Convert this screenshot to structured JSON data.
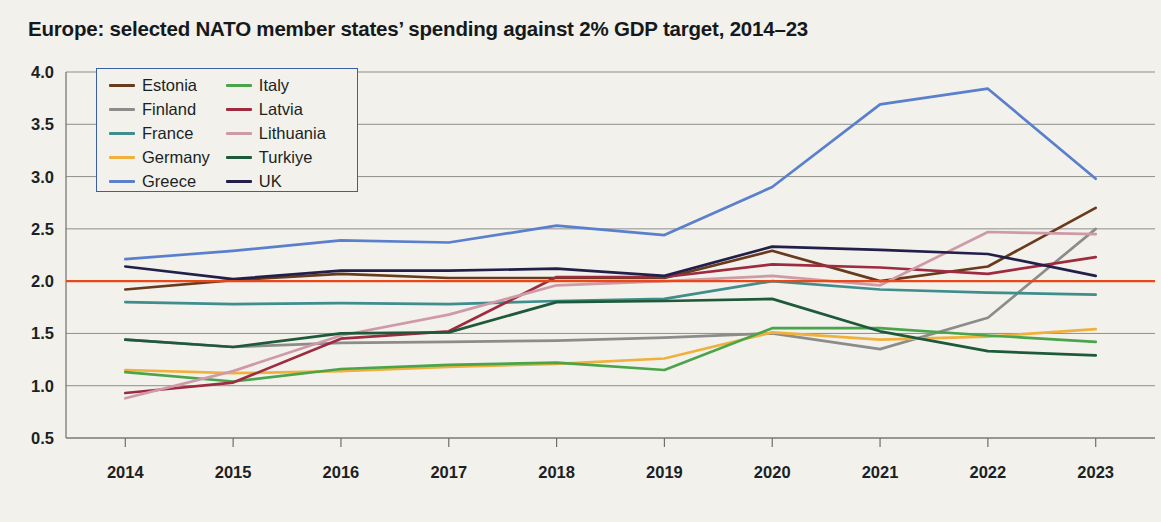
{
  "header": {
    "title": "Europe: selected NATO member states’ spending against 2% GDP target, 2014–23"
  },
  "legend": {
    "position": "top-left-inside",
    "border_color": "#3b5fa5",
    "columns": [
      [
        "Estonia",
        "Finland",
        "France",
        "Germany",
        "Greece"
      ],
      [
        "Italy",
        "Latvia",
        "Lithuania",
        "Turkiye",
        "UK"
      ]
    ]
  },
  "chart_data": {
    "type": "line",
    "title": "Europe: selected NATO member states’ spending against 2% GDP target, 2014–23",
    "xlabel": "",
    "ylabel": "",
    "x": [
      2014,
      2015,
      2016,
      2017,
      2018,
      2019,
      2020,
      2021,
      2022,
      2023
    ],
    "categories": [
      "2014",
      "2015",
      "2016",
      "2017",
      "2018",
      "2019",
      "2020",
      "2021",
      "2022",
      "2023"
    ],
    "ylim": [
      0.5,
      4.0
    ],
    "yticks": [
      "0.5",
      "1.0",
      "1.5",
      "2.0",
      "2.5",
      "3.0",
      "3.5",
      "4.0"
    ],
    "ytick_values": [
      0.5,
      1.0,
      1.5,
      2.0,
      2.5,
      3.0,
      3.5,
      4.0
    ],
    "grid": true,
    "legend_position": "upper left",
    "target_line": {
      "label": "2% GDP target",
      "value": 2.0,
      "color": "#e8491b"
    },
    "series": [
      {
        "name": "Estonia",
        "color": "#6a3a1c",
        "values": [
          1.92,
          2.01,
          2.07,
          2.03,
          2.03,
          2.03,
          2.29,
          2.0,
          2.14,
          2.7
        ]
      },
      {
        "name": "Finland",
        "color": "#8c8c8a",
        "values": [
          1.44,
          1.37,
          1.41,
          1.42,
          1.43,
          1.46,
          1.5,
          1.35,
          1.65,
          2.5
        ]
      },
      {
        "name": "France",
        "color": "#3f8d8c",
        "values": [
          1.8,
          1.78,
          1.79,
          1.78,
          1.81,
          1.83,
          2.0,
          1.92,
          1.89,
          1.87
        ]
      },
      {
        "name": "Germany",
        "color": "#efb13c",
        "values": [
          1.15,
          1.12,
          1.14,
          1.18,
          1.21,
          1.26,
          1.51,
          1.44,
          1.47,
          1.54
        ]
      },
      {
        "name": "Greece",
        "color": "#5a7fcc",
        "values": [
          2.21,
          2.29,
          2.39,
          2.37,
          2.53,
          2.44,
          2.9,
          3.69,
          3.84,
          2.98
        ]
      },
      {
        "name": "Italy",
        "color": "#4aa44a",
        "values": [
          1.13,
          1.04,
          1.16,
          1.2,
          1.22,
          1.15,
          1.55,
          1.55,
          1.48,
          1.42
        ]
      },
      {
        "name": "Latvia",
        "color": "#9e2b3f",
        "values": [
          0.93,
          1.03,
          1.45,
          1.52,
          2.04,
          2.04,
          2.16,
          2.13,
          2.07,
          2.23
        ]
      },
      {
        "name": "Lithuania",
        "color": "#cf9aa8",
        "values": [
          0.88,
          1.14,
          1.48,
          1.68,
          1.96,
          2.0,
          2.05,
          1.96,
          2.47,
          2.45
        ]
      },
      {
        "name": "Turkiye",
        "color": "#1e5a3a",
        "values": [
          1.44,
          1.37,
          1.5,
          1.51,
          1.8,
          1.81,
          1.83,
          1.52,
          1.33,
          1.29
        ]
      },
      {
        "name": "UK",
        "color": "#22204a",
        "values": [
          2.14,
          2.02,
          2.1,
          2.1,
          2.12,
          2.05,
          2.33,
          2.3,
          2.26,
          2.05
        ]
      }
    ]
  }
}
